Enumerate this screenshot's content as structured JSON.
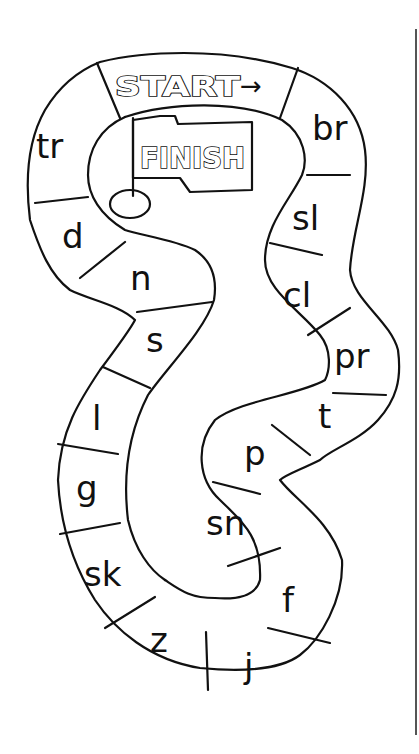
{
  "board": {
    "start_label": "START",
    "start_arrow": "→",
    "finish_label": "FINISH",
    "spaces": [
      {
        "index": 0,
        "label": "br"
      },
      {
        "index": 1,
        "label": "sl"
      },
      {
        "index": 2,
        "label": "cl"
      },
      {
        "index": 3,
        "label": "pr"
      },
      {
        "index": 4,
        "label": "t"
      },
      {
        "index": 5,
        "label": "p"
      },
      {
        "index": 6,
        "label": "sn"
      },
      {
        "index": 7,
        "label": "f"
      },
      {
        "index": 8,
        "label": "j"
      },
      {
        "index": 9,
        "label": "z"
      },
      {
        "index": 10,
        "label": "sk"
      },
      {
        "index": 11,
        "label": "g"
      },
      {
        "index": 12,
        "label": "l"
      },
      {
        "index": 13,
        "label": "s"
      },
      {
        "index": 14,
        "label": "n"
      },
      {
        "index": 15,
        "label": "d"
      },
      {
        "index": 16,
        "label": "tr"
      }
    ]
  },
  "colors": {
    "ink": "#111111",
    "paper": "#ffffff",
    "rule": "#555555"
  }
}
